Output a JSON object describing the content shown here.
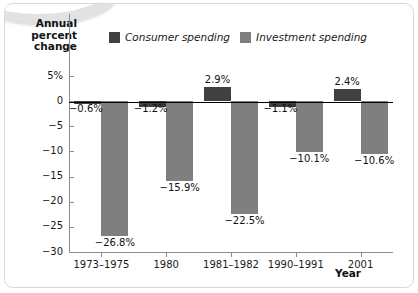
{
  "chart_data": {
    "type": "bar",
    "title": "",
    "xlabel": "Year",
    "ylabel": "Annual percent change",
    "ylabel_lines": [
      "Annual",
      "percent",
      "change"
    ],
    "categories": [
      "1973–1975",
      "1980",
      "1981–1982",
      "1990–1991",
      "2001"
    ],
    "series": [
      {
        "name": "Consumer spending",
        "color": "#404040",
        "values": [
          -0.6,
          -1.2,
          2.9,
          -1.1,
          2.4
        ],
        "labels": [
          "−0.6%",
          "−1.2%",
          "2.9%",
          "−1.1%",
          "2.4%"
        ]
      },
      {
        "name": "Investment spending",
        "color": "#7f7f7f",
        "values": [
          -26.8,
          -15.9,
          -22.5,
          -10.1,
          -10.6
        ],
        "labels": [
          "−26.8%",
          "−15.9%",
          "−22.5%",
          "−10.1%",
          "−10.6%"
        ]
      }
    ],
    "ylim": [
      -30,
      5
    ],
    "yticks": [
      5,
      0,
      -5,
      -10,
      -15,
      -20,
      -25,
      -30
    ],
    "ytick_labels": [
      "5%",
      "0",
      "−5",
      "−10",
      "−15",
      "−20",
      "−25",
      "−30"
    ],
    "grid": false,
    "legend_position": "top-center"
  },
  "legend": {
    "items": [
      {
        "label": "Consumer spending",
        "color": "#404040"
      },
      {
        "label": "Investment spending",
        "color": "#7f7f7f"
      }
    ]
  }
}
